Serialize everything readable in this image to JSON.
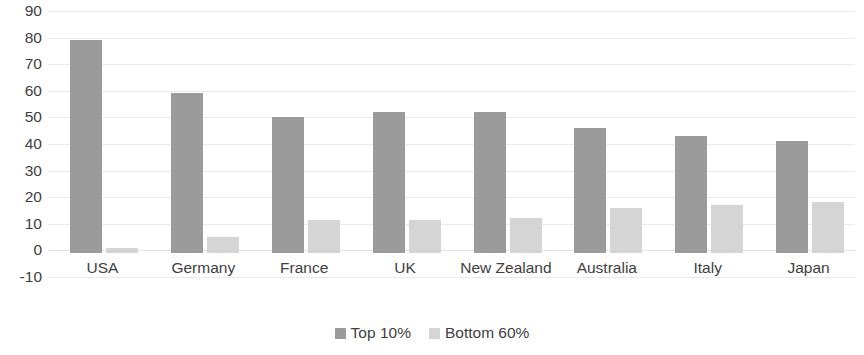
{
  "chart_data": {
    "type": "bar",
    "title": "",
    "subtitle": "",
    "xlabel": "",
    "ylabel": "",
    "categories": [
      "USA",
      "Germany",
      "France",
      "UK",
      "New Zealand",
      "Australia",
      "Italy",
      "Japan"
    ],
    "series": [
      {
        "name": "Top 10%",
        "color": "#9b9b9b",
        "values": [
          80,
          60,
          51,
          53,
          53,
          47,
          44,
          42
        ]
      },
      {
        "name": "Bottom 60%",
        "color": "#d5d5d5",
        "values": [
          2,
          6,
          12.5,
          12.5,
          13,
          17,
          18,
          19
        ]
      }
    ],
    "ylim": [
      -10,
      90
    ],
    "ytick_values": [
      90,
      80,
      70,
      60,
      50,
      40,
      30,
      20,
      10,
      0,
      -10
    ],
    "ytick_labels": [
      "90",
      "80",
      "70",
      "60",
      "50",
      "40",
      "30",
      "20",
      "10",
      "0",
      "-10"
    ],
    "ystep": 10,
    "grid": true,
    "grid_axis": "y",
    "grid_color": "#eaeaea",
    "legend_position": "bottom",
    "background_color": "#ffffff",
    "axis_text_color": "#404040"
  }
}
